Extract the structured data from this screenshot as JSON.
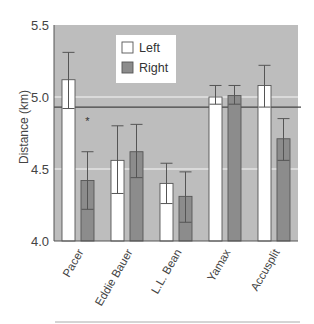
{
  "chart_data": {
    "type": "bar",
    "title": "",
    "xlabel": "",
    "ylabel": "Distance (km)",
    "ylim": [
      4.0,
      5.5
    ],
    "yticks": [
      "4.0",
      "4.5",
      "5.0",
      "5.5"
    ],
    "grid": true,
    "legend_position": "upper-left-center",
    "categories": [
      "Pacer",
      "Eddie Bauer",
      "L.L. Bean",
      "Yamax",
      "Accusplit"
    ],
    "series": [
      {
        "name": "Left",
        "color": "#ffffff",
        "values": [
          5.12,
          4.56,
          4.4,
          5.0,
          5.08
        ],
        "error_upper": [
          5.31,
          4.8,
          4.54,
          5.08,
          5.22
        ],
        "error_lower": [
          4.92,
          4.33,
          4.26,
          4.95,
          4.93
        ]
      },
      {
        "name": "Right",
        "color": "#8c8c8c",
        "values": [
          4.42,
          4.62,
          4.31,
          5.01,
          4.71
        ],
        "error_upper": [
          4.62,
          4.81,
          4.48,
          5.08,
          4.85
        ],
        "error_lower": [
          4.22,
          4.44,
          4.13,
          4.95,
          4.56
        ]
      }
    ],
    "reference_line": {
      "value": 4.93
    },
    "annotations": [
      {
        "text": "*",
        "category": "Pacer",
        "series": "Right",
        "y": 4.83
      }
    ]
  },
  "colors": {
    "plot_background": "#bdbdbd",
    "grid": "#e4e4e4",
    "left_bar": "#ffffff",
    "right_bar": "#8c8c8c",
    "bar_stroke": "#555555",
    "reference_line": "#444444",
    "legend_background": "#ffffff"
  }
}
